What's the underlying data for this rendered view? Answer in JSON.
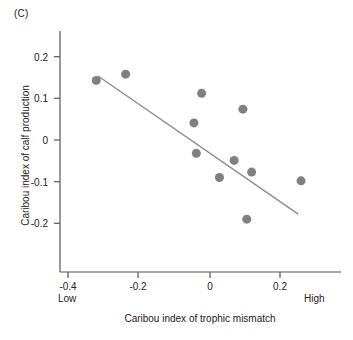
{
  "panel": {
    "label": "(C)"
  },
  "chart_data": {
    "type": "scatter",
    "title": "",
    "xlabel": "Caribou index of trophic mismatch",
    "ylabel": "Caribou index of calf production",
    "xlim": [
      -0.45,
      0.37
    ],
    "ylim": [
      -0.255,
      0.255
    ],
    "grid": false,
    "legend": null,
    "xticks": [
      -0.4,
      -0.2,
      0,
      0.2
    ],
    "xtick_labels": [
      "-0.4",
      "-0.2",
      "0",
      "0.2"
    ],
    "yticks": [
      0.2,
      0.1,
      0,
      -0.1,
      -0.2
    ],
    "ytick_labels": [
      "0.2",
      "0.1",
      "0",
      "-0.1",
      "-0.2"
    ],
    "x_axis_endcaps": {
      "left": "Low",
      "right": "High"
    },
    "marker": {
      "shape": "circle",
      "color": "#808080",
      "size": 9
    },
    "points": [
      {
        "x": -0.325,
        "y": 0.143
      },
      {
        "x": -0.241,
        "y": 0.158
      },
      {
        "x": -0.024,
        "y": 0.112
      },
      {
        "x": 0.094,
        "y": 0.074
      },
      {
        "x": -0.046,
        "y": 0.041
      },
      {
        "x": -0.039,
        "y": -0.032
      },
      {
        "x": 0.069,
        "y": -0.049
      },
      {
        "x": 0.027,
        "y": -0.09
      },
      {
        "x": 0.119,
        "y": -0.077
      },
      {
        "x": 0.26,
        "y": -0.098
      },
      {
        "x": 0.105,
        "y": -0.19
      }
    ],
    "trendline": {
      "type": "linear-fit",
      "color": "#8c8c8c",
      "x_start": -0.319,
      "y_start": 0.153,
      "x_end": 0.252,
      "y_end": -0.178
    }
  }
}
